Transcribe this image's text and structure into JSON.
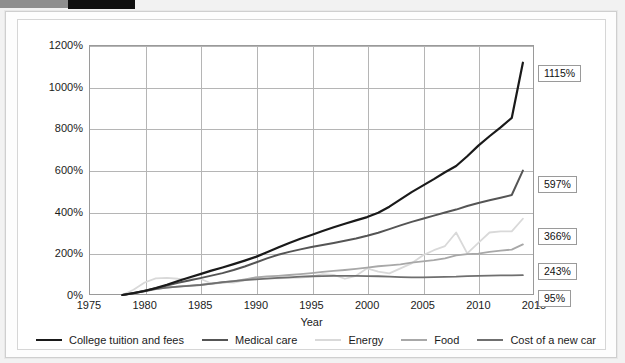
{
  "decor": {
    "bar_gray_color": "#8e8e8e",
    "bar_black_color": "#101010",
    "frame_border_color": "#cfcfcf"
  },
  "chart_data": {
    "type": "line",
    "title": "",
    "xlabel": "Year",
    "ylabel": "",
    "xlim": [
      1975,
      2015
    ],
    "ylim": [
      0,
      1200
    ],
    "grid": true,
    "legend_position": "bottom",
    "xticks": [
      "1975",
      "1980",
      "1985",
      "1990",
      "1995",
      "2000",
      "2005",
      "2010",
      "2015"
    ],
    "xtick_values": [
      1975,
      1980,
      1985,
      1990,
      1995,
      2000,
      2005,
      2010,
      2015
    ],
    "yticks": [
      "0%",
      "200%",
      "400%",
      "600%",
      "800%",
      "1000%",
      "1200%"
    ],
    "ytick_values": [
      0,
      200,
      400,
      600,
      800,
      1000,
      1200
    ],
    "series": [
      {
        "name": "College tuition and fees",
        "color": "#1a1a1a",
        "width": 2.2,
        "end_label": "1115%",
        "end_value": 1115,
        "x": [
          1978,
          1979,
          1980,
          1981,
          1982,
          1983,
          1984,
          1985,
          1986,
          1987,
          1988,
          1989,
          1990,
          1991,
          1992,
          1993,
          1994,
          1995,
          1996,
          1997,
          1998,
          1999,
          2000,
          2001,
          2002,
          2003,
          2004,
          2005,
          2006,
          2007,
          2008,
          2009,
          2010,
          2011,
          2012,
          2013,
          2014
        ],
        "values": [
          0,
          9,
          19,
          33,
          49,
          67,
          84,
          100,
          117,
          132,
          148,
          165,
          183,
          205,
          228,
          250,
          270,
          288,
          307,
          325,
          342,
          358,
          374,
          395,
          424,
          459,
          494,
          525,
          556,
          589,
          619,
          666,
          717,
          762,
          805,
          850,
          1115
        ]
      },
      {
        "name": "Medical care",
        "color": "#555555",
        "width": 2.0,
        "end_label": "597%",
        "end_value": 597,
        "x": [
          1978,
          1979,
          1980,
          1981,
          1982,
          1983,
          1984,
          1985,
          1986,
          1987,
          1988,
          1989,
          1990,
          1991,
          1992,
          1993,
          1994,
          1995,
          1996,
          1997,
          1998,
          1999,
          2000,
          2001,
          2002,
          2003,
          2004,
          2005,
          2006,
          2007,
          2008,
          2009,
          2010,
          2011,
          2012,
          2013,
          2014
        ],
        "values": [
          0,
          9,
          20,
          32,
          45,
          59,
          70,
          81,
          93,
          105,
          120,
          137,
          156,
          176,
          193,
          207,
          219,
          230,
          240,
          250,
          260,
          271,
          284,
          299,
          316,
          334,
          351,
          366,
          381,
          396,
          410,
          427,
          442,
          455,
          467,
          480,
          597
        ]
      },
      {
        "name": "Energy",
        "color": "#d9d9d9",
        "width": 1.8,
        "end_label": "366%",
        "end_value": 366,
        "x": [
          1978,
          1979,
          1980,
          1981,
          1982,
          1983,
          1984,
          1985,
          1986,
          1987,
          1988,
          1989,
          1990,
          1991,
          1992,
          1993,
          1994,
          1995,
          1996,
          1997,
          1998,
          1999,
          2000,
          2001,
          2002,
          2003,
          2004,
          2005,
          2006,
          2007,
          2008,
          2009,
          2010,
          2011,
          2012,
          2013,
          2014
        ],
        "values": [
          0,
          25,
          60,
          80,
          82,
          78,
          77,
          78,
          55,
          62,
          60,
          70,
          85,
          80,
          80,
          82,
          84,
          88,
          100,
          97,
          78,
          92,
          128,
          112,
          104,
          128,
          152,
          190,
          215,
          235,
          300,
          200,
          250,
          300,
          305,
          305,
          366
        ]
      },
      {
        "name": "Food",
        "color": "#a8a8a8",
        "width": 1.8,
        "end_label": "243%",
        "end_value": 243,
        "x": [
          1978,
          1979,
          1980,
          1981,
          1982,
          1983,
          1984,
          1985,
          1986,
          1987,
          1988,
          1989,
          1990,
          1991,
          1992,
          1993,
          1994,
          1995,
          1996,
          1997,
          1998,
          1999,
          2000,
          2001,
          2002,
          2003,
          2004,
          2005,
          2006,
          2007,
          2008,
          2009,
          2010,
          2011,
          2012,
          2013,
          2014
        ],
        "values": [
          0,
          10,
          21,
          30,
          36,
          40,
          45,
          49,
          54,
          60,
          66,
          75,
          84,
          89,
          92,
          96,
          100,
          105,
          111,
          116,
          120,
          125,
          131,
          138,
          142,
          147,
          155,
          161,
          167,
          176,
          190,
          196,
          199,
          207,
          213,
          218,
          243
        ]
      },
      {
        "name": "Cost of a new car",
        "color": "#6f6f6f",
        "width": 1.8,
        "end_label": "95%",
        "end_value": 95,
        "x": [
          1978,
          1979,
          1980,
          1981,
          1982,
          1983,
          1984,
          1985,
          1986,
          1987,
          1988,
          1989,
          1990,
          1991,
          1992,
          1993,
          1994,
          1995,
          1996,
          1997,
          1998,
          1999,
          2000,
          2001,
          2002,
          2003,
          2004,
          2005,
          2006,
          2007,
          2008,
          2009,
          2010,
          2011,
          2012,
          2013,
          2014
        ],
        "values": [
          0,
          8,
          18,
          28,
          35,
          40,
          44,
          48,
          55,
          62,
          67,
          71,
          75,
          79,
          82,
          85,
          88,
          90,
          91,
          92,
          92,
          92,
          91,
          90,
          88,
          86,
          85,
          85,
          86,
          87,
          88,
          91,
          92,
          93,
          94,
          94,
          95
        ]
      }
    ]
  }
}
